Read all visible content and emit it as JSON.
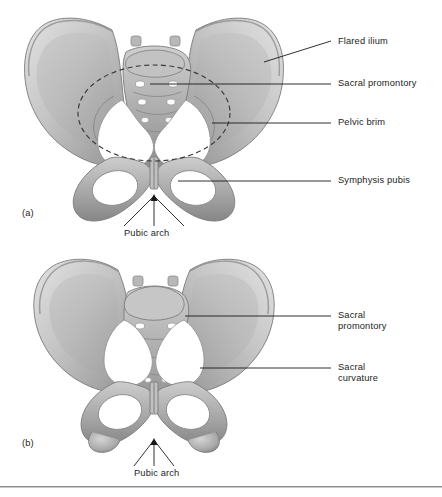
{
  "figure": {
    "background_color": "#ffffff",
    "line_color": "#1a1a1a",
    "text_color": "#1d1d1d",
    "bone_light": "#d8d8d8",
    "bone_mid": "#a9a9a9",
    "bone_dark": "#7d7d7d",
    "bone_shadow": "#5f5f5f"
  },
  "panels": [
    {
      "letter": "(a)",
      "subject": "female-pelvis",
      "labels": [
        {
          "id": "flared-ilium",
          "text": "Flared ilium",
          "lines": [
            "Flared ilium"
          ]
        },
        {
          "id": "sacral-promontory",
          "text": "Sacral promontory",
          "lines": [
            "Sacral promontory"
          ]
        },
        {
          "id": "pelvic-brim",
          "text": "Pelvic brim",
          "lines": [
            "Pelvic brim"
          ]
        },
        {
          "id": "symphysis-pubis",
          "text": "Symphysis pubis",
          "lines": [
            "Symphysis pubis"
          ]
        },
        {
          "id": "pubic-arch",
          "text": "Pubic arch",
          "lines": [
            "Pubic arch"
          ]
        }
      ]
    },
    {
      "letter": "(b)",
      "subject": "male-pelvis",
      "labels": [
        {
          "id": "sacral-promontory",
          "text": "Sacral promontory",
          "lines": [
            "Sacral",
            "promontory"
          ]
        },
        {
          "id": "sacral-curvature",
          "text": "Sacral curvature",
          "lines": [
            "Sacral",
            "curvature"
          ]
        },
        {
          "id": "pubic-arch",
          "text": "Pubic arch",
          "lines": [
            "Pubic arch"
          ]
        }
      ]
    }
  ],
  "label_text": {
    "a_flared_ilium": "Flared ilium",
    "a_sacral_promontory": "Sacral promontory",
    "a_pelvic_brim": "Pelvic brim",
    "a_symphysis_pubis": "Symphysis pubis",
    "a_pubic_arch": "Pubic arch",
    "a_letter": "(a)",
    "b_sacral_promontory_l1": "Sacral",
    "b_sacral_promontory_l2": "promontory",
    "b_sacral_curvature_l1": "Sacral",
    "b_sacral_curvature_l2": "curvature",
    "b_pubic_arch": "Pubic arch",
    "b_letter": "(b)"
  }
}
